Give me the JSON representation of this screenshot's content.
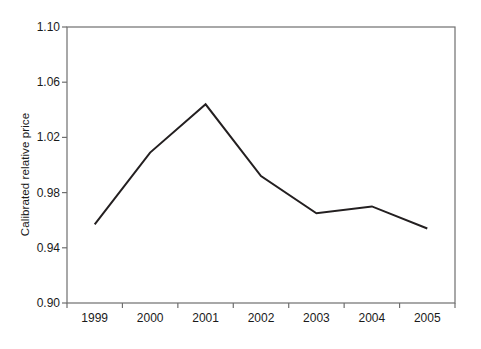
{
  "chart_data": {
    "type": "line",
    "title": "",
    "xlabel": "",
    "ylabel": "Calibrated relative price",
    "categories": [
      "1999",
      "2000",
      "2001",
      "2002",
      "2003",
      "2004",
      "2005"
    ],
    "x": [
      1999,
      2000,
      2001,
      2002,
      2003,
      2004,
      2005
    ],
    "values": [
      0.957,
      1.009,
      1.044,
      0.992,
      0.965,
      0.97,
      0.954
    ],
    "series": [
      {
        "name": "Calibrated relative price",
        "values": [
          0.957,
          1.009,
          1.044,
          0.992,
          0.965,
          0.97,
          0.954
        ]
      }
    ],
    "ylim": [
      0.9,
      1.1
    ],
    "y_ticks": [
      0.9,
      0.94,
      0.98,
      1.02,
      1.06,
      1.1
    ],
    "y_tick_labels": [
      "0.90",
      "0.94",
      "0.98",
      "1.02",
      "1.06",
      "1.10"
    ],
    "x_tick_labels": [
      "1999",
      "2000",
      "2001",
      "2002",
      "2003",
      "2004",
      "2005"
    ],
    "grid": false,
    "legend": false,
    "legend_position": "none",
    "line_color": "#231f20",
    "line_width": 2,
    "frame_color": "#6f6f6f",
    "background": "#ffffff"
  },
  "layout": {
    "plot_left": 67,
    "plot_right": 455,
    "plot_top": 27,
    "plot_bottom": 303
  }
}
